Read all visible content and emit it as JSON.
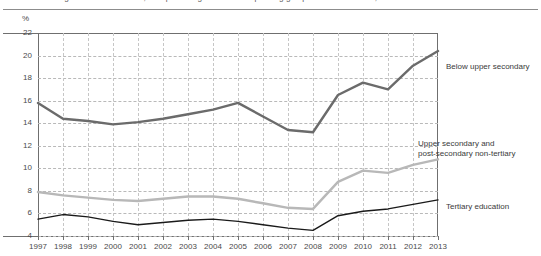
{
  "figure": {
    "title": "Average in OECD countries, as a percentage of the corresponding group in the labour force, 1997-2013",
    "unit_label": "%"
  },
  "chart_data": {
    "type": "line",
    "title": "Average in OECD countries, as a percentage of the corresponding group in the labour force, 1997-2013",
    "xlabel": "",
    "ylabel": "%",
    "ylim": [
      4,
      22
    ],
    "ytick_step": 2,
    "yticks": [
      22,
      20,
      18,
      16,
      14,
      12,
      10,
      8,
      6,
      4
    ],
    "grid": true,
    "legend_position": "right-inline",
    "x": [
      1997,
      1998,
      1999,
      2000,
      2001,
      2002,
      2003,
      2004,
      2005,
      2006,
      2007,
      2008,
      2009,
      2010,
      2011,
      2012,
      2013
    ],
    "categories": [
      "1997",
      "1998",
      "1999",
      "2000",
      "2001",
      "2002",
      "2003",
      "2004",
      "2005",
      "2006",
      "2007",
      "2008",
      "2009",
      "2010",
      "2011",
      "2012",
      "2013"
    ],
    "series": [
      {
        "name": "Below upper secondary",
        "color": "#6b6b6b",
        "values": [
          15.8,
          14.4,
          14.2,
          13.9,
          14.1,
          14.4,
          14.8,
          15.2,
          15.8,
          14.6,
          13.4,
          13.2,
          16.5,
          17.6,
          17.0,
          19.1,
          20.4
        ]
      },
      {
        "name": "Upper secondary and post-secondary non-tertiary",
        "color": "#b8b8b8",
        "values": [
          7.9,
          7.6,
          7.4,
          7.2,
          7.1,
          7.3,
          7.5,
          7.5,
          7.3,
          6.9,
          6.5,
          6.4,
          8.8,
          9.8,
          9.6,
          10.3,
          10.8
        ]
      },
      {
        "name": "Tertiary education",
        "color": "#1a1a1a",
        "values": [
          5.5,
          5.9,
          5.7,
          5.3,
          5.0,
          5.2,
          5.4,
          5.5,
          5.3,
          5.0,
          4.7,
          4.5,
          5.8,
          6.2,
          6.4,
          6.8,
          7.2
        ]
      }
    ],
    "annotations": [
      {
        "text": "Below upper secondary",
        "series": "Below upper secondary"
      },
      {
        "text": "Upper secondary and",
        "series": "Upper secondary and post-secondary non-tertiary"
      },
      {
        "text": "post-secondary non-tertiary",
        "series": "Upper secondary and post-secondary non-tertiary"
      },
      {
        "text": "Tertiary education",
        "series": "Tertiary education"
      }
    ]
  },
  "legend": {
    "below_upper_secondary": "Below upper secondary",
    "upper_secondary_line1": "Upper secondary and",
    "upper_secondary_line2": "post-secondary non-tertiary",
    "tertiary": "Tertiary education"
  }
}
